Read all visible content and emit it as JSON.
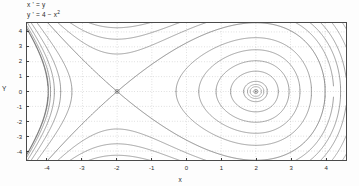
{
  "figure": {
    "equation_line1": "x ' = y",
    "equation_line2_pre": "y ' = 4 − x",
    "equation_line2_sup": "2",
    "xlabel": "x",
    "ylabel": "Y",
    "background_color": "#ffffff",
    "frame_color": "#4a4a4a",
    "grid_color": "#9a9a9a",
    "curve_color": "#555555",
    "equilibrium_color": "#6b6b6b"
  },
  "chart_data": {
    "type": "line",
    "xlabel": "x",
    "ylabel": "Y",
    "xlim": [
      -4.6,
      4.6
    ],
    "ylim": [
      -4.6,
      4.6
    ],
    "grid": true,
    "legend": "none",
    "xticks": [
      -4,
      -3,
      -2,
      -1,
      0,
      1,
      2,
      3,
      4
    ],
    "yticks": [
      4,
      3,
      2,
      1,
      0,
      -1,
      -2,
      -3,
      -4
    ],
    "xtick_labels": [
      "-4",
      "-3",
      "-2",
      "-1",
      "0",
      "1",
      "2",
      "3",
      "4"
    ],
    "ytick_labels": [
      "4",
      "3",
      "2",
      "1",
      "0",
      "-1",
      "-2",
      "-3",
      "-4"
    ],
    "system": {
      "xdot": "y",
      "ydot": "4 - x^2",
      "hamiltonian": "y^2/2 - 4x + x^3/3"
    },
    "equilibria": [
      {
        "name": "saddle",
        "x": -2,
        "y": 0,
        "type": "saddle"
      },
      {
        "name": "center",
        "x": 2,
        "y": 0,
        "type": "center"
      }
    ],
    "separatrix_energy": 5.333333,
    "orbit_energies": [
      -5.1,
      -4.4,
      -3.2,
      -1.4,
      1.2,
      5.3333,
      8.5,
      11.5,
      14.5
    ]
  },
  "ticks": {
    "y": [
      {
        "label": "4",
        "value": 4
      },
      {
        "label": "3",
        "value": 3
      },
      {
        "label": "2",
        "value": 2
      },
      {
        "label": "1",
        "value": 1
      },
      {
        "label": "0",
        "value": 0
      },
      {
        "label": "-1",
        "value": -1
      },
      {
        "label": "-2",
        "value": -2
      },
      {
        "label": "-3",
        "value": -3
      },
      {
        "label": "-4",
        "value": -4
      }
    ],
    "x": [
      {
        "label": "-4",
        "value": -4
      },
      {
        "label": "-3",
        "value": -3
      },
      {
        "label": "-2",
        "value": -2
      },
      {
        "label": "-1",
        "value": -1
      },
      {
        "label": "0",
        "value": 0
      },
      {
        "label": "1",
        "value": 1
      },
      {
        "label": "2",
        "value": 2
      },
      {
        "label": "3",
        "value": 3
      },
      {
        "label": "4",
        "value": 4
      }
    ]
  }
}
